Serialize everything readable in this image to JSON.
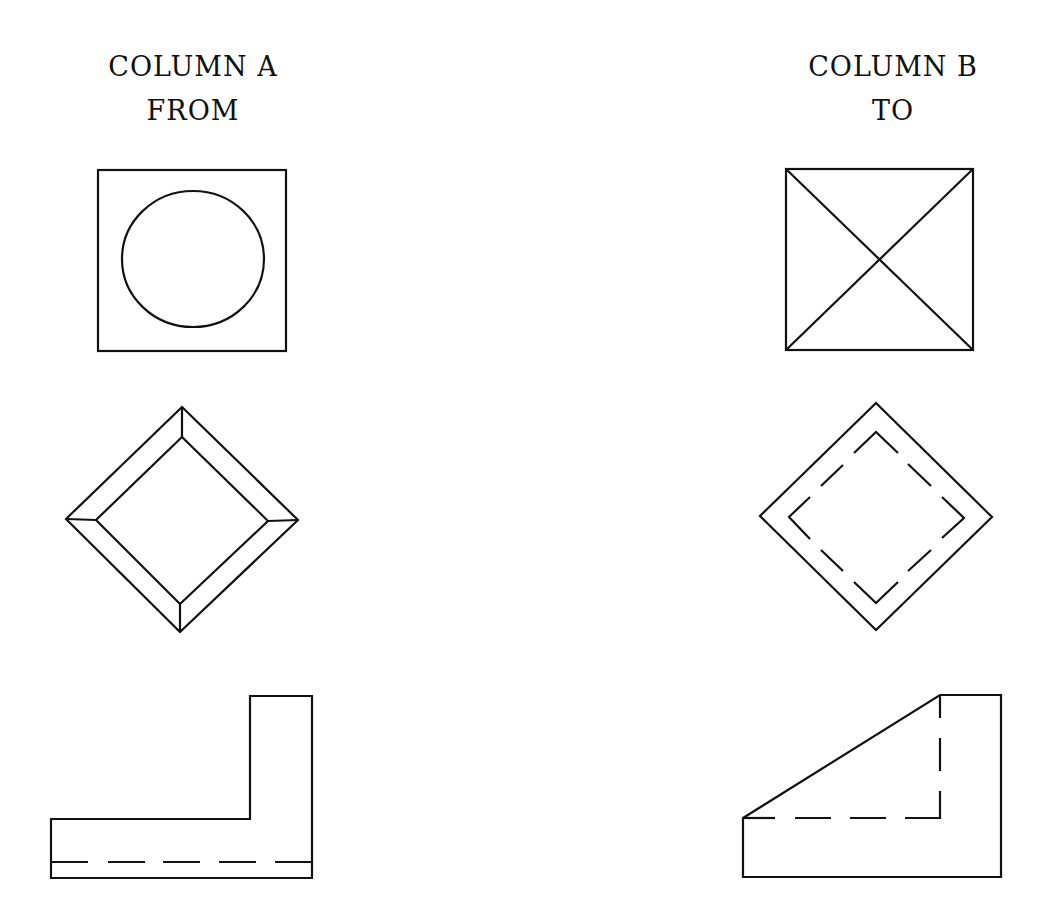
{
  "columns": [
    {
      "id": "A",
      "title": "COLUMN A",
      "subtitle": "FROM"
    },
    {
      "id": "B",
      "title": "COLUMN B",
      "subtitle": "TO"
    }
  ],
  "figures": [
    {
      "row": 1,
      "column_a": {
        "name": "square-with-inscribed-circle",
        "shape": "square outline containing a circle"
      },
      "column_b": {
        "name": "square-with-diagonals",
        "shape": "square outline with both diagonals forming an X"
      }
    },
    {
      "row": 2,
      "column_a": {
        "name": "beveled-diamond",
        "shape": "diamond with inner diamond and corner connecting lines (pyramid frustum top view)"
      },
      "column_b": {
        "name": "diamond-with-hidden-inner-diamond",
        "shape": "diamond outline with dashed inner diamond (hidden lines)"
      }
    },
    {
      "row": 3,
      "column_a": {
        "name": "l-bracket-profile",
        "shape": "L-shaped profile with dashed hidden line near bottom"
      },
      "column_b": {
        "name": "sloped-block-profile",
        "shape": "block with sloped top face and dashed hidden L-shaped lines"
      }
    }
  ],
  "colors": {
    "line": "#111111",
    "background": "#ffffff"
  }
}
